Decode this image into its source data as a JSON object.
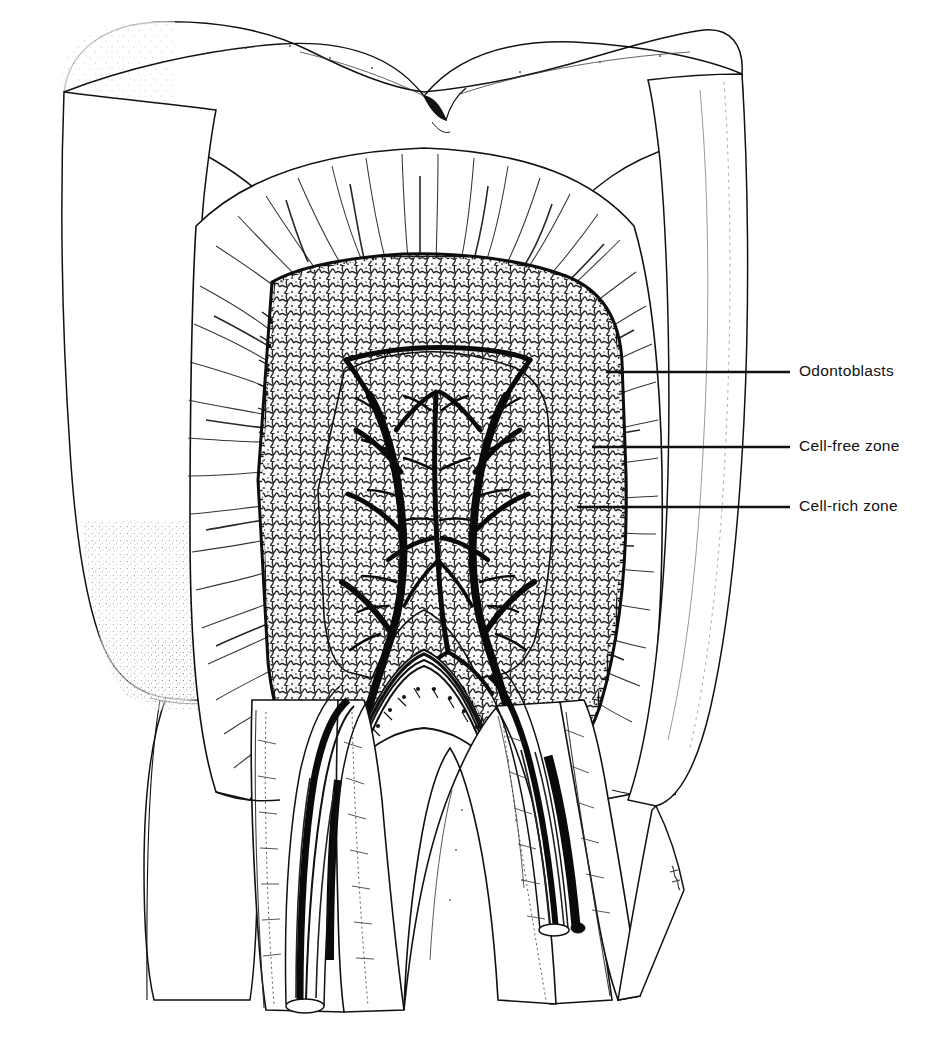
{
  "figure": {
    "domain": "anatomical line drawing",
    "background_color": "#ffffff",
    "ink_color": "#111111",
    "width": 950,
    "height": 1042
  },
  "annotations": [
    {
      "id": "odontoblasts",
      "label": "Odontoblasts",
      "text_x": 799,
      "text_y": 371,
      "leader_x1": 606,
      "leader_x2": 790,
      "leader_y": 372
    },
    {
      "id": "cell-free-zone",
      "label": "Cell-free zone",
      "text_x": 799,
      "text_y": 446,
      "leader_x1": 592,
      "leader_x2": 790,
      "leader_y": 447
    },
    {
      "id": "cell-rich-zone",
      "label": "Cell-rich zone",
      "text_x": 799,
      "text_y": 506,
      "leader_x1": 577,
      "leader_x2": 790,
      "leader_y": 507
    }
  ],
  "structures": [
    {
      "name": "enamel",
      "description": "outer hard shell of crown, stippled shading along margins"
    },
    {
      "name": "occlusal-fissure",
      "description": "central groove between two cusps at crown apex"
    },
    {
      "name": "dentin",
      "description": "body of crown and roots with radiating dentinal tubule striations"
    },
    {
      "name": "pulp-chamber",
      "description": "central cavity containing soft tissue"
    },
    {
      "name": "odontoblast-layer",
      "description": "palisade of columnar cells with dark nuclei lining pulp chamber"
    },
    {
      "name": "cell-free-zone",
      "description": "narrow pale band of Weil immediately internal to odontoblasts"
    },
    {
      "name": "cell-rich-zone",
      "description": "densely cellular band internal to cell-free zone"
    },
    {
      "name": "pulp-core",
      "description": "central pulp with branching arterioles, venules and capillary plexus"
    },
    {
      "name": "root-canal",
      "description": "two divergent root canals carrying neurovascular bundles"
    },
    {
      "name": "cementum",
      "description": "stippled thin layer on external root surface"
    },
    {
      "name": "artist-signature",
      "description": "small initials near lower right of root"
    }
  ],
  "signature": ""
}
